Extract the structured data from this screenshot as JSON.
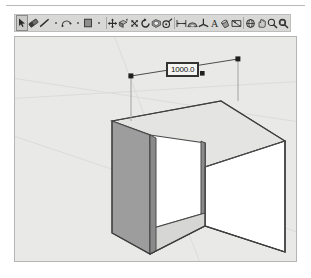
{
  "app": {
    "name": "SketchUp",
    "accent_color": "#d8d8d6",
    "viewport_bg": "#e9e9e7"
  },
  "toolbar": {
    "name": "Principal toolbar",
    "selected_index": 0,
    "tools": [
      {
        "icon": "select-arrow-icon",
        "label": "Select",
        "selected": true,
        "separator_after": false
      },
      {
        "icon": "eraser-icon",
        "label": "Eraser",
        "selected": false,
        "separator_after": false
      },
      {
        "icon": "line-icon",
        "label": "Line",
        "selected": false,
        "separator_after": false
      },
      {
        "icon": "line-dropdown-icon",
        "label": "Line options",
        "selected": false,
        "separator_after": false
      },
      {
        "icon": "arc-icon",
        "label": "Arc",
        "selected": false,
        "separator_after": false
      },
      {
        "icon": "arc-dropdown-icon",
        "label": "Arc options",
        "selected": false,
        "separator_after": false
      },
      {
        "icon": "rectangle-icon",
        "label": "Rectangle",
        "selected": false,
        "separator_after": false
      },
      {
        "icon": "rectangle-dropdown-icon",
        "label": "Shape options",
        "selected": false,
        "separator_after": true
      },
      {
        "icon": "move-icon",
        "label": "Move",
        "selected": false,
        "separator_after": false
      },
      {
        "icon": "pushpull-icon",
        "label": "Push/Pull",
        "selected": false,
        "separator_after": false
      },
      {
        "icon": "scale-icon",
        "label": "Scale",
        "selected": false,
        "separator_after": false
      },
      {
        "icon": "rotate-icon",
        "label": "Rotate",
        "selected": false,
        "separator_after": false
      },
      {
        "icon": "offset-icon",
        "label": "Offset",
        "selected": false,
        "separator_after": false
      },
      {
        "icon": "tape-measure-icon",
        "label": "Tape Measure",
        "selected": false,
        "separator_after": true
      },
      {
        "icon": "dimension-icon",
        "label": "Dimensions",
        "selected": false,
        "separator_after": false
      },
      {
        "icon": "protractor-icon",
        "label": "Protractor",
        "selected": false,
        "separator_after": false
      },
      {
        "icon": "axes-icon",
        "label": "Axes",
        "selected": false,
        "separator_after": false
      },
      {
        "icon": "text-icon",
        "label": "Text",
        "selected": false,
        "separator_after": false
      },
      {
        "icon": "paint-bucket-icon",
        "label": "Paint Bucket",
        "selected": false,
        "separator_after": false
      },
      {
        "icon": "section-plane-icon",
        "label": "Section Plane",
        "selected": false,
        "separator_after": true
      },
      {
        "icon": "orbit-icon",
        "label": "Orbit",
        "selected": false,
        "separator_after": false
      },
      {
        "icon": "pan-icon",
        "label": "Pan",
        "selected": false,
        "separator_after": false
      },
      {
        "icon": "zoom-icon",
        "label": "Zoom",
        "selected": false,
        "separator_after": false
      },
      {
        "icon": "zoom-extents-icon",
        "label": "Zoom Extents",
        "selected": false,
        "separator_after": false
      }
    ]
  },
  "viewport": {
    "name": "3D modelling viewport",
    "model_name": "notched-box",
    "dimension": {
      "value": "1000.0",
      "name": "dimension-value-label"
    },
    "colors": {
      "top_face": "#e3e3e1",
      "front_face": "#ffffff",
      "left_face": "#9a9a9a",
      "inner_right_face": "#8d8d8d",
      "inner_floor": "#d8d8d6",
      "edge": "#4a4a4a"
    }
  }
}
